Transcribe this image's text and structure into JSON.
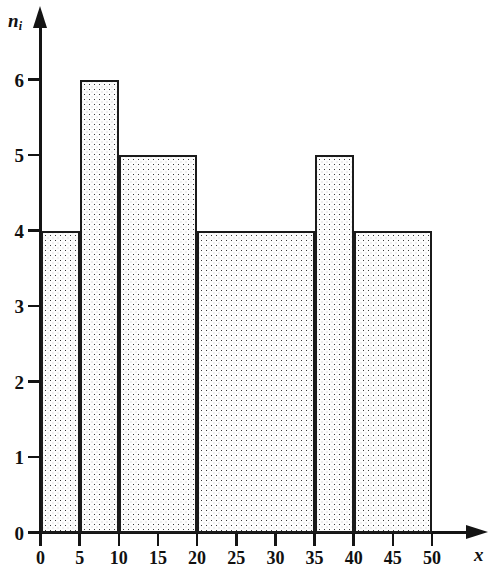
{
  "figure": {
    "type": "histogram",
    "background_color": "#ffffff",
    "line_color": "#141414",
    "fill_pattern": "dotted-stipple",
    "fill_dot_color": "#3a3a3a",
    "fill_background_color": "#fdfdfd"
  },
  "axes": {
    "y": {
      "title": "n",
      "title_subscript": "i",
      "ticks": [
        "0",
        "1",
        "2",
        "3",
        "4",
        "5",
        "6"
      ],
      "min": 0,
      "max": 6,
      "arrow": "up-arrow-icon"
    },
    "x": {
      "title": "x",
      "ticks": [
        "0",
        "5",
        "10",
        "15",
        "20",
        "25",
        "30",
        "35",
        "40",
        "45",
        "50"
      ],
      "min": 0,
      "max": 50,
      "arrow": "right-arrow-icon"
    }
  },
  "chart_data": {
    "type": "bar",
    "title": "",
    "subtitle": "",
    "xlabel": "x",
    "ylabel": "n_i",
    "xlim": [
      0,
      50
    ],
    "ylim": [
      0,
      6
    ],
    "grid": false,
    "legend": false,
    "x_ticks": [
      0,
      5,
      10,
      15,
      20,
      25,
      30,
      35,
      40,
      45,
      50
    ],
    "y_ticks": [
      0,
      1,
      2,
      3,
      4,
      5,
      6
    ],
    "bins": [
      {
        "label": "0-5",
        "x_start": 0,
        "x_end": 5,
        "value": 4
      },
      {
        "label": "5-10",
        "x_start": 5,
        "x_end": 10,
        "value": 6
      },
      {
        "label": "10-20",
        "x_start": 10,
        "x_end": 20,
        "value": 5
      },
      {
        "label": "20-35",
        "x_start": 20,
        "x_end": 35,
        "value": 4
      },
      {
        "label": "35-40",
        "x_start": 35,
        "x_end": 40,
        "value": 5
      },
      {
        "label": "40-50",
        "x_start": 40,
        "x_end": 50,
        "value": 4
      }
    ],
    "categories": [
      "0-5",
      "5-10",
      "10-20",
      "20-35",
      "35-40",
      "40-50"
    ],
    "values": [
      4,
      6,
      5,
      4,
      5,
      4
    ]
  }
}
